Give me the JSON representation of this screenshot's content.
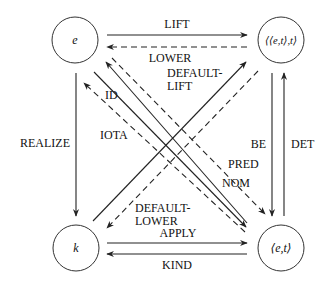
{
  "diagram": {
    "nodes": {
      "e": {
        "label": "e"
      },
      "et_t": {
        "label": "⟨⟨e,t⟩,t⟩"
      },
      "k": {
        "label": "k"
      },
      "et": {
        "label": "⟨e,t⟩"
      }
    },
    "edges": {
      "lift": {
        "label": "LIFT",
        "from": "e",
        "to": "⟨⟨e,t⟩,t⟩",
        "style": "solid"
      },
      "lower": {
        "label": "LOWER",
        "from": "⟨⟨e,t⟩,t⟩",
        "to": "e",
        "style": "dashed"
      },
      "default_lift": {
        "label1": "DEFAULT-",
        "label2": "LIFT",
        "from": "k",
        "to": "⟨⟨e,t⟩,t⟩",
        "style": "solid"
      },
      "id": {
        "label": "ID",
        "from": "⟨e,t⟩",
        "to": "e",
        "style": "solid"
      },
      "iota": {
        "label": "IOTA",
        "from": "⟨e,t⟩",
        "to": "e",
        "style": "dashed"
      },
      "realize": {
        "label": "REALIZE",
        "from": "e",
        "to": "k",
        "style": "solid"
      },
      "be": {
        "label": "BE",
        "from": "⟨⟨e,t⟩,t⟩",
        "to": "⟨e,t⟩",
        "style": "solid"
      },
      "det": {
        "label": "DET",
        "from": "⟨e,t⟩",
        "to": "⟨⟨e,t⟩,t⟩",
        "style": "solid"
      },
      "pred": {
        "label": "PRED",
        "from": "e",
        "to": "⟨e,t⟩",
        "style": "dashed"
      },
      "nom": {
        "label": "NOM",
        "from": "e",
        "to": "⟨e,t⟩",
        "style": "solid"
      },
      "default_lower": {
        "label1": "DEFAULT-",
        "label2": "LOWER",
        "from": "⟨⟨e,t⟩,t⟩",
        "to": "k",
        "style": "dashed"
      },
      "apply": {
        "label": "APPLY",
        "from": "k",
        "to": "⟨e,t⟩",
        "style": "solid"
      },
      "kind": {
        "label": "KIND",
        "from": "⟨e,t⟩",
        "to": "k",
        "style": "solid"
      }
    }
  }
}
